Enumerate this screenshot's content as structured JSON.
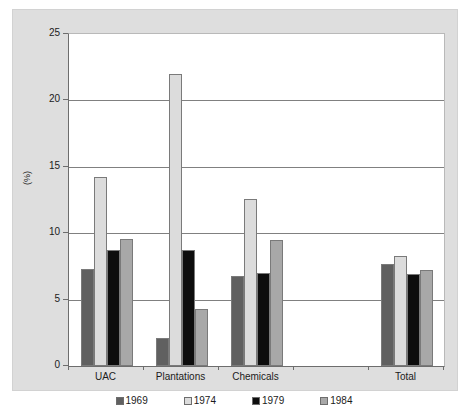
{
  "chart_data": {
    "type": "bar",
    "title": "",
    "subtitle": "",
    "xlabel": "",
    "ylabel": "(%)",
    "ylim": [
      0,
      25
    ],
    "yticks": [
      0,
      5,
      10,
      15,
      20,
      25
    ],
    "ytick_labels": [
      "0",
      "5",
      "10",
      "15",
      "20",
      "25"
    ],
    "grid": true,
    "grid_axis": "y",
    "legend_position": "bottom",
    "categories": [
      "UAC",
      "Plantations",
      "Chemicals",
      "",
      "Total"
    ],
    "series": [
      {
        "name": "1969",
        "color": "#606060",
        "values": [
          7.3,
          2.1,
          6.8,
          null,
          7.7
        ]
      },
      {
        "name": "1974",
        "color": "#dcdcdc",
        "values": [
          14.2,
          22.0,
          12.6,
          null,
          8.3
        ]
      },
      {
        "name": "1979",
        "color": "#0d0d0d",
        "values": [
          8.7,
          8.7,
          7.0,
          null,
          6.9
        ]
      },
      {
        "name": "1984",
        "color": "#a8a8a8",
        "values": [
          9.6,
          4.3,
          9.5,
          null,
          7.2
        ]
      }
    ]
  },
  "axis": {
    "y_label": "(%)",
    "tick_0": "0",
    "tick_5": "5",
    "tick_10": "10",
    "tick_15": "15",
    "tick_20": "20",
    "tick_25": "25"
  },
  "categories_labels": {
    "uac": "UAC",
    "plantations": "Plantations",
    "chemicals": "Chemicals",
    "blank": "",
    "total": "Total"
  },
  "legend": {
    "items": [
      {
        "label": "1969",
        "color": "#606060"
      },
      {
        "label": "1974",
        "color": "#dcdcdc"
      },
      {
        "label": "1979",
        "color": "#0d0d0d"
      },
      {
        "label": "1984",
        "color": "#a8a8a8"
      }
    ]
  },
  "colors": {
    "figure_background": "#dedede",
    "plot_background": "#ffffff",
    "axis_line": "#6d6d6d",
    "gridline": "#808080",
    "text": "#1b1b1b"
  }
}
